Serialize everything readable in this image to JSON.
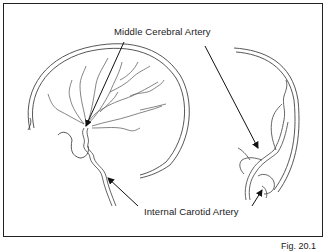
{
  "diagram": {
    "labels": {
      "top": "Middle Cerebral Artery",
      "bottom": "Internal Carotid Artery"
    },
    "figure_caption": "Fig. 20.1",
    "views": [
      {
        "name": "lateral-view",
        "description": "Sagittal skull outline with internal carotid and middle cerebral artery branches"
      },
      {
        "name": "frontal-view",
        "description": "Coronal skull outline with internal carotid and middle cerebral artery"
      }
    ],
    "colors": {
      "outline": "#333333",
      "vessel": "#555555",
      "arrow": "#111111",
      "frame": "#222222"
    }
  }
}
